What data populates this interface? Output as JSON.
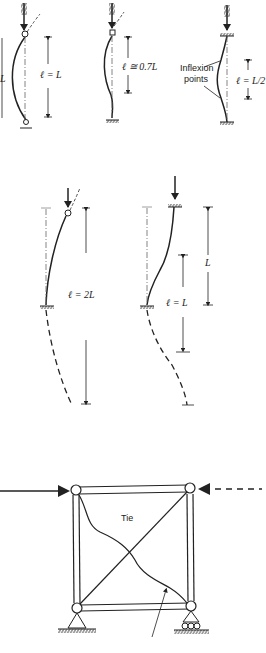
{
  "diagram": {
    "panels": [
      {
        "id": "pinned-pinned",
        "label": "ℓ = L",
        "side_label": "L"
      },
      {
        "id": "fixed-pinned",
        "label": "ℓ ≅ 0.7L"
      },
      {
        "id": "fixed-fixed",
        "label": "ℓ = L/2",
        "annotation": [
          "Inflexion",
          "points"
        ]
      },
      {
        "id": "fixed-free",
        "label": "ℓ = 2L"
      },
      {
        "id": "fixed-fixed-sway",
        "label": "ℓ = L",
        "side_label": "L"
      }
    ],
    "frame": {
      "tie_label": "Tie"
    }
  }
}
